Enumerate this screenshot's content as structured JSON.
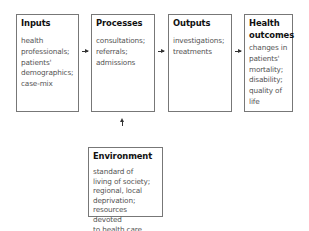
{
  "boxes": {
    "inputs": {
      "title": "Inputs",
      "lines": [
        "health",
        "professionals;",
        "patients'",
        "demographics;",
        "case-mix"
      ]
    },
    "processes": {
      "title": "Processes",
      "lines": [
        "consultations;",
        "referrals;",
        "admissions"
      ]
    },
    "outputs": {
      "title": "Outputs",
      "lines": [
        "investigations;",
        "treatments"
      ]
    },
    "health_outcomes": {
      "title_line1": "Health",
      "title_line2": "outcomes",
      "lines": [
        "changes in",
        "patients'",
        "mortality;",
        "disability;",
        "quality of",
        "life"
      ]
    },
    "environment": {
      "title": "Environment",
      "lines": [
        "standard of",
        "living of society;",
        "regional, local",
        "deprivation;",
        "resources devoted",
        "to health care"
      ]
    }
  },
  "arrows": [
    {
      "from": "inputs",
      "to": "processes",
      "direction": "right"
    },
    {
      "from": "processes",
      "to": "outputs",
      "direction": "right"
    },
    {
      "from": "outputs",
      "to": "health_outcomes",
      "direction": "right"
    },
    {
      "from": "environment",
      "to": "processes",
      "direction": "up"
    }
  ]
}
